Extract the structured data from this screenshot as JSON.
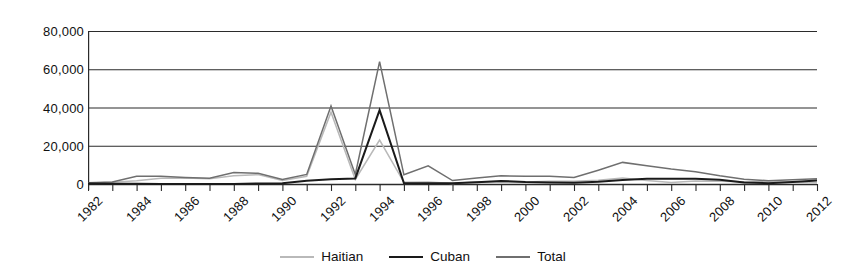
{
  "chart_data": {
    "type": "line",
    "title": "",
    "subtitle": "",
    "xlabel": "",
    "ylabel": "",
    "grid": true,
    "legend_position": "bottom-center",
    "xlim": [
      1982,
      2012
    ],
    "ylim": [
      0,
      80000
    ],
    "ytick_labels": [
      "80,000",
      "60,000",
      "40,000",
      "20,000",
      "0"
    ],
    "ytick_values": [
      80000,
      60000,
      40000,
      20000,
      0
    ],
    "xtick_labels": [
      "1982",
      "1984",
      "1986",
      "1988",
      "1990",
      "1992",
      "1994",
      "1996",
      "1998",
      "2000",
      "2002",
      "2004",
      "2006",
      "2008",
      "2010",
      "2012"
    ],
    "xtick_values": [
      1982,
      1984,
      1986,
      1988,
      1990,
      1992,
      1994,
      1996,
      1998,
      2000,
      2002,
      2004,
      2006,
      2008,
      2010,
      2012
    ],
    "x": [
      1982,
      1983,
      1984,
      1985,
      1986,
      1987,
      1988,
      1989,
      1990,
      1991,
      1992,
      1993,
      1994,
      1995,
      1996,
      1997,
      1998,
      1999,
      2000,
      2001,
      2002,
      2003,
      2004,
      2005,
      2006,
      2007,
      2008,
      2009,
      2010,
      2011,
      2012
    ],
    "series": [
      {
        "name": "Haitian",
        "color": "#b9b9b9",
        "values": [
          400,
          900,
          1700,
          3000,
          3100,
          2800,
          4300,
          4900,
          1800,
          4000,
          37500,
          2400,
          23000,
          900,
          1100,
          300,
          1200,
          1000,
          1100,
          1400,
          1500,
          2000,
          3200,
          1800,
          800,
          1600,
          1500,
          1200,
          1100,
          1000,
          700
        ]
      },
      {
        "name": "Cuban",
        "color": "#1a1a1a",
        "values": [
          200,
          100,
          100,
          60,
          30,
          50,
          60,
          300,
          400,
          1700,
          2500,
          2900,
          38600,
          500,
          400,
          400,
          900,
          1600,
          1000,
          800,
          700,
          1200,
          2100,
          2700,
          2800,
          2800,
          2200,
          800,
          400,
          1000,
          1800
        ]
      },
      {
        "name": "Total",
        "color": "#6f6f6f",
        "values": [
          700,
          1100,
          4100,
          4000,
          3400,
          3000,
          6000,
          5600,
          2400,
          5000,
          40800,
          5000,
          64000,
          4800,
          9500,
          1800,
          3100,
          4300,
          4000,
          4100,
          3400,
          7200,
          11300,
          9500,
          7800,
          6400,
          4300,
          2500,
          1700,
          2200,
          2700
        ]
      }
    ]
  },
  "legend": {
    "items": [
      {
        "label": "Haitian",
        "color": "#b9b9b9"
      },
      {
        "label": "Cuban",
        "color": "#1a1a1a"
      },
      {
        "label": "Total",
        "color": "#6f6f6f"
      }
    ]
  }
}
